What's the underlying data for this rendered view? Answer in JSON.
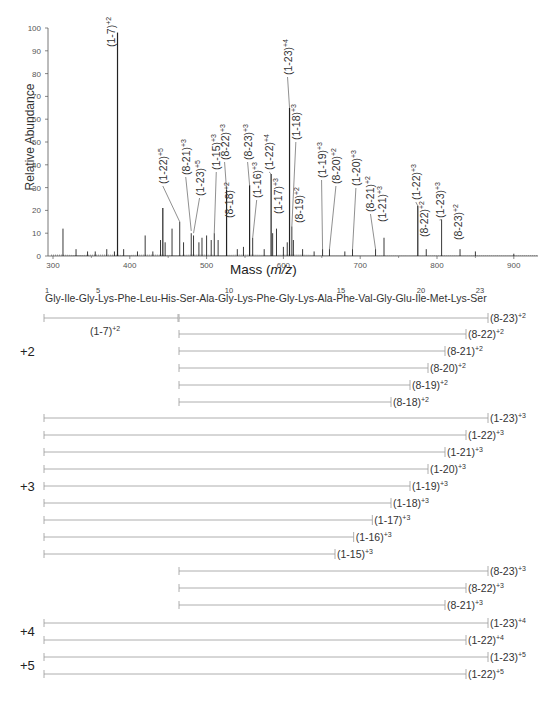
{
  "chart_data": [
    {
      "type": "bar",
      "subtype": "mass-spectrum",
      "title": "",
      "xlabel": "Mass (m/z)",
      "ylabel": "Relative Abundance",
      "xlim": [
        295,
        935
      ],
      "ylim": [
        0,
        100
      ],
      "x_ticks": [
        300,
        400,
        500,
        600,
        700,
        800,
        900
      ],
      "y_ticks": [
        0,
        10,
        20,
        30,
        40,
        50,
        60,
        70,
        80,
        90,
        100
      ],
      "grid": false,
      "legend": null,
      "peaks": [
        {
          "mz": 313,
          "intensity": 12
        },
        {
          "mz": 330,
          "intensity": 3
        },
        {
          "mz": 345,
          "intensity": 2
        },
        {
          "mz": 355,
          "intensity": 2
        },
        {
          "mz": 370,
          "intensity": 3
        },
        {
          "mz": 380,
          "intensity": 2
        },
        {
          "mz": 384,
          "intensity": 98,
          "label": "(1-7)+2"
        },
        {
          "mz": 392,
          "intensity": 3
        },
        {
          "mz": 410,
          "intensity": 2
        },
        {
          "mz": 420,
          "intensity": 9
        },
        {
          "mz": 430,
          "intensity": 2
        },
        {
          "mz": 440,
          "intensity": 7
        },
        {
          "mz": 443,
          "intensity": 21
        },
        {
          "mz": 446,
          "intensity": 6
        },
        {
          "mz": 455,
          "intensity": 12
        },
        {
          "mz": 465,
          "intensity": 15,
          "label": "(1-22)+5"
        },
        {
          "mz": 470,
          "intensity": 6
        },
        {
          "mz": 480,
          "intensity": 10,
          "label": "(8-21)+3"
        },
        {
          "mz": 483,
          "intensity": 9,
          "label": "(1-23)+5"
        },
        {
          "mz": 490,
          "intensity": 6
        },
        {
          "mz": 494,
          "intensity": 8
        },
        {
          "mz": 500,
          "intensity": 9
        },
        {
          "mz": 506,
          "intensity": 7
        },
        {
          "mz": 510,
          "intensity": 10,
          "label": "(1-15)+3"
        },
        {
          "mz": 515,
          "intensity": 7
        },
        {
          "mz": 526,
          "intensity": 29,
          "label": "(8-22)+3"
        },
        {
          "mz": 540,
          "intensity": 3,
          "label": "(8-18)+2"
        },
        {
          "mz": 548,
          "intensity": 4
        },
        {
          "mz": 556,
          "intensity": 31,
          "label": "(8-23)+3"
        },
        {
          "mz": 560,
          "intensity": 8,
          "label": "(1-16)+3"
        },
        {
          "mz": 575,
          "intensity": 3
        },
        {
          "mz": 584,
          "intensity": 36,
          "label": "(1-22)+4"
        },
        {
          "mz": 586,
          "intensity": 10
        },
        {
          "mz": 591,
          "intensity": 12,
          "label": "(1-17)+3"
        },
        {
          "mz": 600,
          "intensity": 4
        },
        {
          "mz": 605,
          "intensity": 6
        },
        {
          "mz": 608,
          "intensity": 65,
          "label": "(1-23)+4"
        },
        {
          "mz": 611,
          "intensity": 13,
          "label": "(1-18)+3"
        },
        {
          "mz": 613,
          "intensity": 7,
          "label": "(8-19)+2"
        },
        {
          "mz": 625,
          "intensity": 3
        },
        {
          "mz": 640,
          "intensity": 2
        },
        {
          "mz": 651,
          "intensity": 3,
          "label": "(1-19)+3"
        },
        {
          "mz": 660,
          "intensity": 3,
          "label": "(8-20)+2"
        },
        {
          "mz": 680,
          "intensity": 2
        },
        {
          "mz": 690,
          "intensity": 3,
          "label": "(1-20)+3"
        },
        {
          "mz": 720,
          "intensity": 3,
          "label": "(8-21)+2"
        },
        {
          "mz": 731,
          "intensity": 8,
          "label": "(1-21)+3"
        },
        {
          "mz": 775,
          "intensity": 22,
          "label": "(1-22)+3"
        },
        {
          "mz": 786,
          "intensity": 3,
          "label": "(8-22)+2"
        },
        {
          "mz": 806,
          "intensity": 16,
          "label": "(1-23)+3"
        },
        {
          "mz": 830,
          "intensity": 3,
          "label": "(8-23)+2"
        },
        {
          "mz": 850,
          "intensity": 2
        },
        {
          "mz": 900,
          "intensity": 1
        }
      ]
    },
    {
      "type": "table",
      "subtype": "fragment-coverage-map",
      "sequence": [
        "Gly",
        "Ile",
        "Gly",
        "Lys",
        "Phe",
        "Leu",
        "His",
        "Ser",
        "Ala",
        "Gly",
        "Lys",
        "Phe",
        "Gly",
        "Lys",
        "Ala",
        "Phe",
        "Val",
        "Gly",
        "Glu",
        "Ile",
        "Met",
        "Lys",
        "Ser"
      ],
      "sequence_text": "Gly-Ile-Gly-Lys-Phe-Leu-His-Ser-Ala-Gly-Lys-Phe-Gly-Lys-Ala-Phe-Val-Gly-Glu-Ile-Met-Lys-Ser",
      "residue_numbers": [
        1,
        5,
        10,
        15,
        20,
        23
      ],
      "groups": [
        {
          "charge": "+2",
          "fragments": [
            {
              "label": "(1-7)+2",
              "start": 1,
              "end": 7,
              "label_below": true
            },
            {
              "label": "(8-23)+2",
              "start": 8,
              "end": 23
            },
            {
              "label": "(8-22)+2",
              "start": 8,
              "end": 22
            },
            {
              "label": "(8-21)+2",
              "start": 8,
              "end": 21
            },
            {
              "label": "(8-20)+2",
              "start": 8,
              "end": 20
            },
            {
              "label": "(8-19)+2",
              "start": 8,
              "end": 19
            },
            {
              "label": "(8-18)+2",
              "start": 8,
              "end": 18
            }
          ]
        },
        {
          "charge": "+3",
          "fragments": [
            {
              "label": "(1-23)+3",
              "start": 1,
              "end": 23
            },
            {
              "label": "(1-22)+3",
              "start": 1,
              "end": 22
            },
            {
              "label": "(1-21)+3",
              "start": 1,
              "end": 21
            },
            {
              "label": "(1-20)+3",
              "start": 1,
              "end": 20
            },
            {
              "label": "(1-19)+3",
              "start": 1,
              "end": 19
            },
            {
              "label": "(1-18)+3",
              "start": 1,
              "end": 18
            },
            {
              "label": "(1-17)+3",
              "start": 1,
              "end": 17
            },
            {
              "label": "(1-16)+3",
              "start": 1,
              "end": 16
            },
            {
              "label": "(1-15)+3",
              "start": 1,
              "end": 15
            },
            {
              "label": "(8-23)+3",
              "start": 8,
              "end": 23
            },
            {
              "label": "(8-22)+3",
              "start": 8,
              "end": 22
            },
            {
              "label": "(8-21)+3",
              "start": 8,
              "end": 21
            }
          ]
        },
        {
          "charge": "+4",
          "fragments": [
            {
              "label": "(1-23)+4",
              "start": 1,
              "end": 23
            },
            {
              "label": "(1-22)+4",
              "start": 1,
              "end": 22
            }
          ]
        },
        {
          "charge": "+5",
          "fragments": [
            {
              "label": "(1-23)+5",
              "start": 1,
              "end": 23
            },
            {
              "label": "(1-22)+5",
              "start": 1,
              "end": 22
            }
          ]
        }
      ]
    }
  ],
  "spectrum": {
    "ylabel": "Relative Abundance",
    "xlabel_prefix": "Mass (",
    "xlabel_italic": "m/z",
    "xlabel_suffix": ")"
  },
  "colors": {
    "axis": "#555555",
    "peak": "#222222",
    "bracket": "#999999",
    "text": "#333333"
  }
}
